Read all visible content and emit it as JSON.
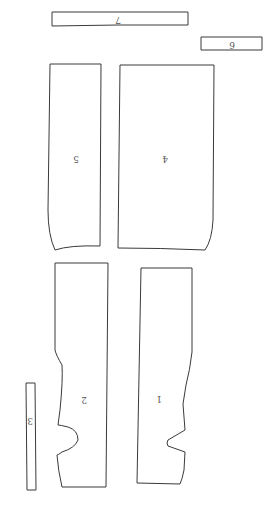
{
  "diagram": {
    "type": "sewing-pattern-pieces",
    "orientation": "rotated-180",
    "pieces": [
      {
        "id": "piece-1",
        "label": "1"
      },
      {
        "id": "piece-2",
        "label": "2"
      },
      {
        "id": "piece-3",
        "label": "3"
      },
      {
        "id": "piece-4",
        "label": "4"
      },
      {
        "id": "piece-5",
        "label": "5"
      },
      {
        "id": "piece-6",
        "label": "6"
      },
      {
        "id": "piece-7",
        "label": "7"
      }
    ],
    "colors": {
      "stroke": "#3a3a3a",
      "background": "#ffffff",
      "label": "#555555"
    }
  }
}
